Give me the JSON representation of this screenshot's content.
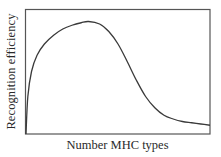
{
  "chart_data": {
    "type": "line",
    "title": "",
    "xlabel": "Number MHC types",
    "ylabel": "Recognition efficiency",
    "x_ticks": [],
    "y_ticks": [],
    "grid": false,
    "legend": null,
    "axis_ranges": {
      "x": [
        0,
        1
      ],
      "y": [
        0,
        1
      ]
    },
    "series": [
      {
        "name": "Recognition efficiency",
        "description": "Qualitative curve: steep rise from origin, peak at ~1/3 of x-range, sigmoid decline toward low plateau",
        "x": [
          0.0,
          0.01,
          0.03,
          0.06,
          0.1,
          0.15,
          0.2,
          0.25,
          0.3,
          0.34,
          0.4,
          0.45,
          0.5,
          0.55,
          0.6,
          0.65,
          0.7,
          0.75,
          0.8,
          0.85,
          0.9,
          0.95,
          1.0
        ],
        "y": [
          0.0,
          0.3,
          0.5,
          0.63,
          0.72,
          0.79,
          0.84,
          0.87,
          0.89,
          0.9,
          0.88,
          0.82,
          0.72,
          0.58,
          0.43,
          0.3,
          0.21,
          0.15,
          0.12,
          0.1,
          0.09,
          0.08,
          0.07
        ]
      }
    ]
  },
  "colors": {
    "line": "#3a3a3a",
    "frame": "#555555",
    "text": "#2a2a2a",
    "background": "#ffffff"
  }
}
